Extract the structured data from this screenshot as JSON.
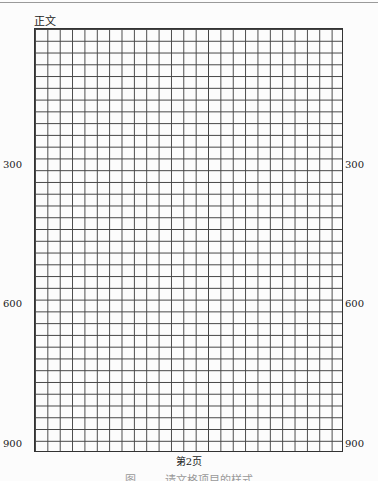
{
  "page": {
    "section_label": "正文",
    "page_number": "第2页",
    "caption": "图 …… 请文格项目的样式",
    "grid": {
      "columns": 25,
      "rows": 36,
      "chars_per_row": 25
    },
    "row_count_labels": [
      {
        "value": "300",
        "row": 12
      },
      {
        "value": "600",
        "row": 24
      },
      {
        "value": "900",
        "row": 36
      }
    ]
  }
}
